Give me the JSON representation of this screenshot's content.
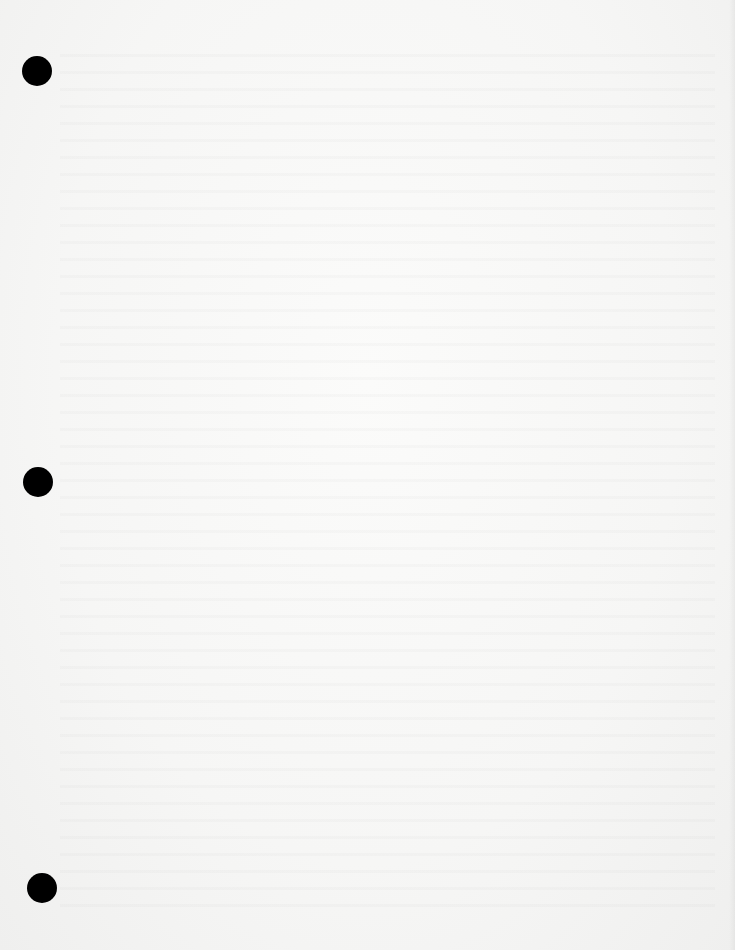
{
  "document": {
    "type": "blank scanned page",
    "content": "",
    "punch_holes": [
      {
        "id": 1,
        "cx": 37,
        "cy": 71
      },
      {
        "id": 2,
        "cx": 38,
        "cy": 482
      },
      {
        "id": 3,
        "cx": 42,
        "cy": 888
      }
    ],
    "colors": {
      "paper": "#f6f6f5",
      "hole": "#000000"
    }
  }
}
